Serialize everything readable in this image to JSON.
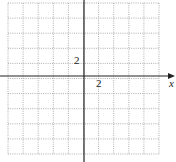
{
  "graph": {
    "x_axis_label": "x",
    "x_tick_label": "2",
    "y_tick_label": "2",
    "grid": {
      "columns": 10,
      "rows": 10,
      "left": 8,
      "top": 3,
      "cell": 15.1,
      "style": "dotted",
      "color": "#9a9a9a"
    },
    "axis_color": "#222222",
    "origin_px": [
      84,
      76
    ]
  }
}
